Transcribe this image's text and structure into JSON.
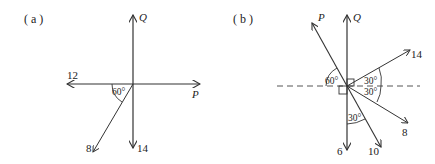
{
  "diagrams": [
    {
      "panel_label": "( a )",
      "forces": {
        "Q": "Q",
        "P": "P",
        "left": "12",
        "down": "14",
        "lower_left": "8"
      },
      "angles": {
        "a1": "60°"
      }
    },
    {
      "panel_label": "( b )",
      "forces": {
        "P": "P",
        "Q": "Q",
        "upper_right": "14",
        "lower_right": "8",
        "down_right": "10",
        "down": "6"
      },
      "angles": {
        "a1": "60°",
        "a2": "30°",
        "a3": "30°",
        "a4": "30°"
      }
    }
  ],
  "colors": {
    "line": "#333333",
    "text": "#222222",
    "background": "#ffffff"
  }
}
